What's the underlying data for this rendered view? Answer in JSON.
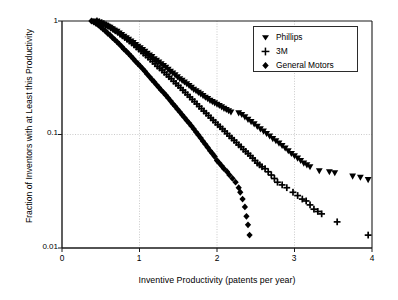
{
  "chart_data": {
    "type": "scatter",
    "title": "",
    "xlabel": "Inventive Productivity (patents per year)",
    "ylabel": "Fraction of Inventors with at Least this Productivity",
    "xlim": [
      0,
      4
    ],
    "ylim": [
      0.01,
      1
    ],
    "yscale": "log",
    "xscale": "linear",
    "xticks": [
      "0",
      "1",
      "2",
      "3",
      "4"
    ],
    "xtick_values": [
      0,
      1,
      2,
      3,
      4
    ],
    "yticks": [
      "1",
      "0.1",
      "0.01"
    ],
    "ytick_values": [
      1,
      0.1,
      0.01
    ],
    "grid": true,
    "grid_style": "dotted gray, both axes at major ticks",
    "legend_position": "top-right inside",
    "series": [
      {
        "name": "Phillips",
        "marker": "triangle-down",
        "color": "#000000",
        "points": [
          [
            0.42,
            1.0
          ],
          [
            0.45,
            0.99
          ],
          [
            0.48,
            0.975
          ],
          [
            0.5,
            0.96
          ],
          [
            0.53,
            0.94
          ],
          [
            0.56,
            0.92
          ],
          [
            0.59,
            0.9
          ],
          [
            0.62,
            0.88
          ],
          [
            0.65,
            0.855
          ],
          [
            0.68,
            0.83
          ],
          [
            0.71,
            0.81
          ],
          [
            0.74,
            0.785
          ],
          [
            0.77,
            0.76
          ],
          [
            0.8,
            0.735
          ],
          [
            0.83,
            0.71
          ],
          [
            0.86,
            0.69
          ],
          [
            0.89,
            0.665
          ],
          [
            0.92,
            0.645
          ],
          [
            0.95,
            0.62
          ],
          [
            0.98,
            0.6
          ],
          [
            1.01,
            0.58
          ],
          [
            1.04,
            0.56
          ],
          [
            1.07,
            0.54
          ],
          [
            1.1,
            0.52
          ],
          [
            1.13,
            0.5
          ],
          [
            1.16,
            0.485
          ],
          [
            1.19,
            0.465
          ],
          [
            1.22,
            0.45
          ],
          [
            1.25,
            0.435
          ],
          [
            1.28,
            0.42
          ],
          [
            1.31,
            0.405
          ],
          [
            1.34,
            0.39
          ],
          [
            1.37,
            0.375
          ],
          [
            1.4,
            0.36
          ],
          [
            1.43,
            0.348
          ],
          [
            1.46,
            0.335
          ],
          [
            1.49,
            0.322
          ],
          [
            1.52,
            0.31
          ],
          [
            1.55,
            0.3
          ],
          [
            1.58,
            0.29
          ],
          [
            1.61,
            0.28
          ],
          [
            1.64,
            0.27
          ],
          [
            1.67,
            0.26
          ],
          [
            1.7,
            0.25
          ],
          [
            1.73,
            0.243
          ],
          [
            1.76,
            0.235
          ],
          [
            1.79,
            0.228
          ],
          [
            1.82,
            0.22
          ],
          [
            1.85,
            0.213
          ],
          [
            1.88,
            0.207
          ],
          [
            1.91,
            0.2
          ],
          [
            1.94,
            0.195
          ],
          [
            1.97,
            0.19
          ],
          [
            2.0,
            0.185
          ],
          [
            2.03,
            0.18
          ],
          [
            2.06,
            0.175
          ],
          [
            2.09,
            0.17
          ],
          [
            2.12,
            0.166
          ],
          [
            2.15,
            0.162
          ],
          [
            2.18,
            0.158
          ],
          [
            2.28,
            0.155
          ],
          [
            2.32,
            0.15
          ],
          [
            2.36,
            0.143
          ],
          [
            2.4,
            0.136
          ],
          [
            2.44,
            0.13
          ],
          [
            2.48,
            0.124
          ],
          [
            2.52,
            0.118
          ],
          [
            2.56,
            0.112
          ],
          [
            2.6,
            0.107
          ],
          [
            2.64,
            0.102
          ],
          [
            2.68,
            0.097
          ],
          [
            2.72,
            0.092
          ],
          [
            2.76,
            0.088
          ],
          [
            2.8,
            0.084
          ],
          [
            2.84,
            0.08
          ],
          [
            2.88,
            0.076
          ],
          [
            2.92,
            0.072
          ],
          [
            2.96,
            0.068
          ],
          [
            3.0,
            0.065
          ],
          [
            3.04,
            0.062
          ],
          [
            3.08,
            0.059
          ],
          [
            3.12,
            0.056
          ],
          [
            3.16,
            0.054
          ],
          [
            3.2,
            0.052
          ],
          [
            3.32,
            0.048
          ],
          [
            3.45,
            0.047
          ],
          [
            3.52,
            0.046
          ],
          [
            3.75,
            0.043
          ],
          [
            3.85,
            0.042
          ],
          [
            3.95,
            0.04
          ]
        ]
      },
      {
        "name": "3M",
        "marker": "plus",
        "color": "#000000",
        "points": [
          [
            0.45,
            1.0
          ],
          [
            0.48,
            0.985
          ],
          [
            0.51,
            0.965
          ],
          [
            0.54,
            0.945
          ],
          [
            0.57,
            0.92
          ],
          [
            0.6,
            0.9
          ],
          [
            0.63,
            0.87
          ],
          [
            0.66,
            0.845
          ],
          [
            0.69,
            0.82
          ],
          [
            0.72,
            0.795
          ],
          [
            0.75,
            0.765
          ],
          [
            0.78,
            0.74
          ],
          [
            0.81,
            0.715
          ],
          [
            0.84,
            0.69
          ],
          [
            0.87,
            0.665
          ],
          [
            0.9,
            0.64
          ],
          [
            0.93,
            0.615
          ],
          [
            0.96,
            0.59
          ],
          [
            0.99,
            0.565
          ],
          [
            1.02,
            0.545
          ],
          [
            1.05,
            0.52
          ],
          [
            1.08,
            0.5
          ],
          [
            1.11,
            0.48
          ],
          [
            1.14,
            0.46
          ],
          [
            1.17,
            0.44
          ],
          [
            1.2,
            0.42
          ],
          [
            1.23,
            0.4
          ],
          [
            1.26,
            0.385
          ],
          [
            1.29,
            0.37
          ],
          [
            1.32,
            0.353
          ],
          [
            1.35,
            0.338
          ],
          [
            1.38,
            0.323
          ],
          [
            1.41,
            0.31
          ],
          [
            1.44,
            0.295
          ],
          [
            1.47,
            0.282
          ],
          [
            1.5,
            0.27
          ],
          [
            1.53,
            0.258
          ],
          [
            1.56,
            0.246
          ],
          [
            1.59,
            0.235
          ],
          [
            1.62,
            0.224
          ],
          [
            1.65,
            0.214
          ],
          [
            1.68,
            0.204
          ],
          [
            1.71,
            0.195
          ],
          [
            1.74,
            0.186
          ],
          [
            1.77,
            0.177
          ],
          [
            1.8,
            0.169
          ],
          [
            1.83,
            0.161
          ],
          [
            1.86,
            0.154
          ],
          [
            1.89,
            0.147
          ],
          [
            1.92,
            0.14
          ],
          [
            1.95,
            0.134
          ],
          [
            1.98,
            0.128
          ],
          [
            2.01,
            0.122
          ],
          [
            2.04,
            0.117
          ],
          [
            2.07,
            0.112
          ],
          [
            2.1,
            0.107
          ],
          [
            2.13,
            0.102
          ],
          [
            2.16,
            0.097
          ],
          [
            2.19,
            0.093
          ],
          [
            2.22,
            0.089
          ],
          [
            2.25,
            0.085
          ],
          [
            2.28,
            0.081
          ],
          [
            2.31,
            0.078
          ],
          [
            2.34,
            0.074
          ],
          [
            2.37,
            0.071
          ],
          [
            2.4,
            0.068
          ],
          [
            2.43,
            0.065
          ],
          [
            2.46,
            0.062
          ],
          [
            2.49,
            0.059
          ],
          [
            2.52,
            0.056
          ],
          [
            2.55,
            0.054
          ],
          [
            2.58,
            0.052
          ],
          [
            2.62,
            0.05
          ],
          [
            2.66,
            0.047
          ],
          [
            2.7,
            0.044
          ],
          [
            2.74,
            0.041
          ],
          [
            2.78,
            0.038
          ],
          [
            2.84,
            0.036
          ],
          [
            2.9,
            0.034
          ],
          [
            2.98,
            0.031
          ],
          [
            3.04,
            0.029
          ],
          [
            3.1,
            0.027
          ],
          [
            3.15,
            0.026
          ],
          [
            3.2,
            0.024
          ],
          [
            3.25,
            0.022
          ],
          [
            3.3,
            0.021
          ],
          [
            3.35,
            0.02
          ],
          [
            3.55,
            0.017
          ],
          [
            3.95,
            0.013
          ]
        ]
      },
      {
        "name": "General Motors",
        "marker": "diamond",
        "color": "#000000",
        "points": [
          [
            0.38,
            1.0
          ],
          [
            0.41,
            0.98
          ],
          [
            0.44,
            0.95
          ],
          [
            0.47,
            0.92
          ],
          [
            0.5,
            0.885
          ],
          [
            0.53,
            0.85
          ],
          [
            0.56,
            0.815
          ],
          [
            0.59,
            0.78
          ],
          [
            0.62,
            0.75
          ],
          [
            0.65,
            0.715
          ],
          [
            0.68,
            0.685
          ],
          [
            0.71,
            0.655
          ],
          [
            0.74,
            0.625
          ],
          [
            0.77,
            0.595
          ],
          [
            0.8,
            0.565
          ],
          [
            0.83,
            0.54
          ],
          [
            0.86,
            0.515
          ],
          [
            0.89,
            0.49
          ],
          [
            0.92,
            0.465
          ],
          [
            0.95,
            0.44
          ],
          [
            0.98,
            0.42
          ],
          [
            1.01,
            0.4
          ],
          [
            1.04,
            0.38
          ],
          [
            1.07,
            0.36
          ],
          [
            1.1,
            0.34
          ],
          [
            1.13,
            0.322
          ],
          [
            1.16,
            0.305
          ],
          [
            1.19,
            0.29
          ],
          [
            1.22,
            0.274
          ],
          [
            1.25,
            0.26
          ],
          [
            1.28,
            0.246
          ],
          [
            1.31,
            0.234
          ],
          [
            1.34,
            0.222
          ],
          [
            1.37,
            0.21
          ],
          [
            1.4,
            0.198
          ],
          [
            1.43,
            0.187
          ],
          [
            1.46,
            0.177
          ],
          [
            1.49,
            0.167
          ],
          [
            1.52,
            0.158
          ],
          [
            1.55,
            0.149
          ],
          [
            1.58,
            0.141
          ],
          [
            1.61,
            0.133
          ],
          [
            1.64,
            0.126
          ],
          [
            1.67,
            0.119
          ],
          [
            1.7,
            0.112
          ],
          [
            1.73,
            0.105
          ],
          [
            1.76,
            0.099
          ],
          [
            1.79,
            0.093
          ],
          [
            1.82,
            0.087
          ],
          [
            1.85,
            0.082
          ],
          [
            1.88,
            0.077
          ],
          [
            1.91,
            0.072
          ],
          [
            1.94,
            0.068
          ],
          [
            1.97,
            0.064
          ],
          [
            2.0,
            0.059
          ],
          [
            2.03,
            0.056
          ],
          [
            2.06,
            0.053
          ],
          [
            2.09,
            0.05
          ],
          [
            2.13,
            0.047
          ],
          [
            2.16,
            0.044
          ],
          [
            2.2,
            0.041
          ],
          [
            2.24,
            0.038
          ],
          [
            2.28,
            0.034
          ],
          [
            2.3,
            0.031
          ],
          [
            2.33,
            0.027
          ],
          [
            2.36,
            0.023
          ],
          [
            2.38,
            0.019
          ],
          [
            2.4,
            0.016
          ],
          [
            2.42,
            0.013
          ]
        ]
      }
    ]
  },
  "legend": {
    "items": [
      {
        "label": "Phillips",
        "marker": "triangle-down"
      },
      {
        "label": "3M",
        "marker": "plus"
      },
      {
        "label": "General Motors",
        "marker": "diamond"
      }
    ]
  },
  "axes": {
    "x_title": "Inventive Productivity (patents per year)",
    "y_title": "Fraction of Inventors with at Least this Productivity",
    "x_tick_labels": [
      "0",
      "1",
      "2",
      "3",
      "4"
    ],
    "y_tick_labels": [
      "1",
      "0.1",
      "0.01"
    ]
  },
  "colors": {
    "marker": "#000000",
    "axis": "#1a1a1a",
    "grid": "#bdbdbd",
    "background": "#ffffff"
  }
}
